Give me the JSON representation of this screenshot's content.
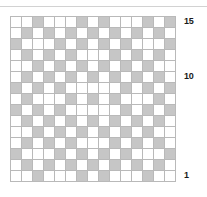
{
  "figure": {
    "title": "",
    "type": "grid-diagram",
    "top_rule_color": "#d2d2d2",
    "cell_on_color": "#c6c6c6",
    "cell_off_color": "#ffffff",
    "cell_border_color": "#b9b9b9",
    "major_line_color": "#6e6e6e",
    "label_color": "#1a1a1a",
    "rows": 15,
    "columns": 15
  },
  "axis": {
    "labels": [
      {
        "text": "15",
        "row": 15
      },
      {
        "text": "10",
        "row": 10
      },
      {
        "text": "1",
        "row": 1
      }
    ]
  },
  "chart_data": {
    "type": "heatmap",
    "title": "",
    "xlabel": "",
    "ylabel": "",
    "grid": true,
    "legend": "none",
    "rows": 15,
    "columns": 15,
    "row_labels": [
      "15",
      "14",
      "13",
      "12",
      "11",
      "10",
      "9",
      "8",
      "7",
      "6",
      "5",
      "4",
      "3",
      "2",
      "1"
    ],
    "column_labels": [
      "1",
      "2",
      "3",
      "4",
      "5",
      "6",
      "7",
      "8",
      "9",
      "10",
      "11",
      "12",
      "13",
      "14",
      "15"
    ],
    "value_legend": {
      "0": "white",
      "1": "gray"
    },
    "major_gridline_columns": [
      6,
      11
    ],
    "cells": [
      [
        0,
        0,
        1,
        0,
        0,
        0,
        1,
        0,
        1,
        0,
        0,
        0,
        1,
        0,
        1
      ],
      [
        0,
        1,
        0,
        1,
        0,
        1,
        0,
        1,
        0,
        1,
        0,
        1,
        0,
        1,
        0
      ],
      [
        1,
        0,
        0,
        0,
        1,
        0,
        1,
        0,
        1,
        0,
        1,
        0,
        0,
        0,
        1
      ],
      [
        0,
        1,
        0,
        1,
        0,
        1,
        0,
        0,
        0,
        1,
        0,
        1,
        0,
        1,
        0
      ],
      [
        0,
        0,
        1,
        0,
        1,
        0,
        1,
        0,
        1,
        0,
        1,
        0,
        1,
        0,
        0
      ],
      [
        0,
        1,
        0,
        1,
        0,
        1,
        0,
        1,
        0,
        1,
        0,
        1,
        0,
        1,
        0
      ],
      [
        1,
        0,
        1,
        0,
        1,
        0,
        0,
        0,
        0,
        0,
        1,
        0,
        1,
        0,
        1
      ],
      [
        0,
        1,
        0,
        0,
        0,
        1,
        0,
        1,
        0,
        1,
        0,
        0,
        0,
        1,
        0
      ],
      [
        1,
        0,
        1,
        0,
        1,
        0,
        0,
        0,
        0,
        0,
        1,
        0,
        1,
        0,
        1
      ],
      [
        0,
        1,
        0,
        1,
        0,
        1,
        0,
        1,
        0,
        1,
        0,
        1,
        0,
        1,
        0
      ],
      [
        0,
        0,
        1,
        0,
        1,
        0,
        1,
        0,
        1,
        0,
        1,
        0,
        1,
        0,
        0
      ],
      [
        0,
        1,
        0,
        1,
        0,
        1,
        0,
        0,
        0,
        1,
        0,
        1,
        0,
        1,
        0
      ],
      [
        1,
        0,
        0,
        0,
        1,
        0,
        1,
        0,
        1,
        0,
        1,
        0,
        0,
        0,
        1
      ],
      [
        0,
        1,
        0,
        1,
        0,
        1,
        0,
        1,
        0,
        1,
        0,
        1,
        0,
        1,
        0
      ],
      [
        0,
        0,
        1,
        0,
        0,
        0,
        1,
        0,
        1,
        0,
        0,
        0,
        1,
        0,
        0
      ]
    ]
  }
}
